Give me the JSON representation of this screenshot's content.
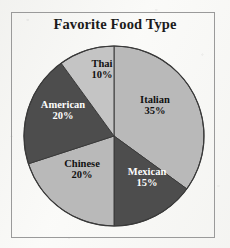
{
  "chart_data": {
    "type": "pie",
    "title": "Favorite Food Type",
    "subtitle": "",
    "xlabel": "",
    "ylabel": "",
    "grid": false,
    "legend": "none",
    "labels_inside_slices": true,
    "start_angle_deg": 0,
    "direction": "clockwise",
    "categories": [
      "Italian",
      "Mexican",
      "Chinese",
      "American",
      "Thai"
    ],
    "values": [
      35,
      15,
      20,
      20,
      10
    ],
    "value_unit": "%",
    "slices": [
      {
        "name": "Italian",
        "value": 35,
        "label": "Italian",
        "percent_label": "35%",
        "color": "#b9b9b9",
        "text_color": "#111111",
        "start_deg": 0,
        "end_deg": 126
      },
      {
        "name": "Mexican",
        "value": 15,
        "label": "Mexican",
        "percent_label": "15%",
        "color": "#4d4d4d",
        "text_color": "#fdfdfd",
        "start_deg": 126,
        "end_deg": 180
      },
      {
        "name": "Chinese",
        "value": 20,
        "label": "Chinese",
        "percent_label": "20%",
        "color": "#b9b9b9",
        "text_color": "#111111",
        "start_deg": 180,
        "end_deg": 252
      },
      {
        "name": "American",
        "value": 20,
        "label": "American",
        "percent_label": "20%",
        "color": "#4d4d4d",
        "text_color": "#fdfdfd",
        "start_deg": 252,
        "end_deg": 324
      },
      {
        "name": "Thai",
        "value": 10,
        "label": "Thai",
        "percent_label": "10%",
        "color": "#c4c4c4",
        "text_color": "#111111",
        "start_deg": 324,
        "end_deg": 360
      }
    ]
  },
  "figure": {
    "frame_border_color": "#9a9a9a",
    "background_color": "#fafaf8",
    "pie_outline_color": "#3a3a3a",
    "center_x": 114,
    "center_y": 136,
    "radius": 90
  }
}
